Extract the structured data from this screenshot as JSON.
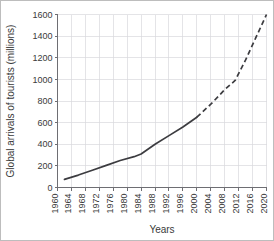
{
  "chart_data": {
    "type": "line",
    "title": "",
    "xlabel": "Years",
    "ylabel": "Global arrivals of tourists (millions)",
    "xlim": [
      1960,
      2020
    ],
    "ylim": [
      0,
      1600
    ],
    "xticks": [
      1960,
      1964,
      1968,
      1972,
      1976,
      1980,
      1984,
      1988,
      1992,
      1996,
      2000,
      2004,
      2008,
      2012,
      2016,
      2020
    ],
    "yticks": [
      0,
      200,
      400,
      600,
      800,
      1000,
      1200,
      1400,
      1600
    ],
    "grid": true,
    "legend": false,
    "line_color": "#3c3c40",
    "grid_color": "#d8d8dd",
    "series": [
      {
        "name": "Observed global arrivals of tourists",
        "style": "solid",
        "x": [
          1962,
          1966,
          1970,
          1974,
          1978,
          1982,
          1984,
          1988,
          1992,
          1996,
          2000
        ],
        "values": [
          75,
          115,
          160,
          205,
          250,
          285,
          310,
          400,
          480,
          560,
          650
        ]
      },
      {
        "name": "Projected global arrivals of tourists",
        "style": "dashed",
        "x": [
          2000,
          2004,
          2008,
          2011,
          2014,
          2017,
          2020
        ],
        "values": [
          650,
          770,
          905,
          990,
          1180,
          1390,
          1600
        ]
      }
    ]
  }
}
